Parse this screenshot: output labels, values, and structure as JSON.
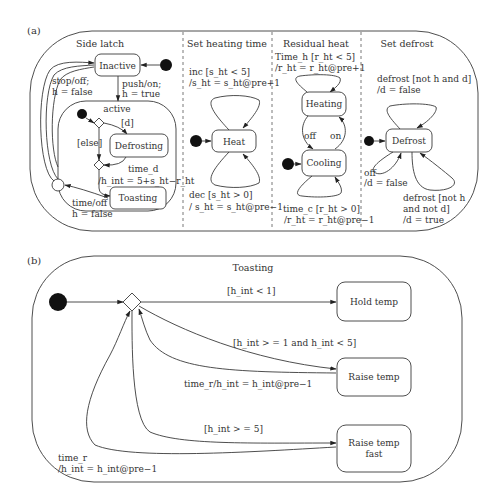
{
  "panel_a": {
    "label": "(a)",
    "regions": {
      "side_latch": {
        "title": "Side latch",
        "states": {
          "inactive": "Inactive",
          "active": "active",
          "defrosting": "Defrosting",
          "toasting": "Toasting"
        },
        "transitions": {
          "stop_off": [
            "stop/off;",
            "h = false"
          ],
          "push_on": [
            "push/on;",
            "h = true"
          ],
          "d_guard": "[d]",
          "else_guard": "[else]",
          "time_d": [
            "time_d",
            "/h_int = 5+s_ht−r_ht"
          ],
          "time_off": [
            "time/off",
            "h = false"
          ]
        }
      },
      "set_heating_time": {
        "title": "Set heating time",
        "states": {
          "heat": "Heat"
        },
        "transitions": {
          "inc": [
            "inc [s_ht < 5]",
            "/s_ht = s_ht@pre+1"
          ],
          "dec": [
            "dec [s_ht > 0]",
            "/ s_ht = s_ht@pre−1"
          ]
        }
      },
      "residual_heat": {
        "title": "Residual heat",
        "states": {
          "heating": "Heating",
          "cooling": "Cooling"
        },
        "transitions": {
          "time_h": [
            "Time_h [r_ht < 5]",
            "/r_ht = r_ht@pre+1"
          ],
          "off": "off",
          "on": "on",
          "time_c": [
            "time_c [r_ht > 0]",
            "/r_ht = r_ht@pre−1"
          ]
        }
      },
      "set_defrost": {
        "title": "Set defrost",
        "states": {
          "defrost": "Defrost"
        },
        "transitions": {
          "defrost_not_h_and_d": [
            "defrost [not h and d]",
            "/d = false"
          ],
          "off": [
            "off",
            "/d = false"
          ],
          "defrost_not_h_and_not_d": [
            "defrost [not h",
            "and not d]",
            "/d = true"
          ]
        }
      }
    }
  },
  "panel_b": {
    "label": "(b)",
    "title": "Toasting",
    "states": {
      "hold_temp": "Hold temp",
      "raise_temp": "Raise temp",
      "raise_temp_fast": [
        "Raise temp",
        "fast"
      ]
    },
    "transitions": {
      "lt1": "[h_int < 1]",
      "range": "[h_int > = 1 and h_int < 5]",
      "time_r_mid": "time_r/h_int = h_int@pre−1",
      "ge5": "[h_int > = 5]",
      "time_r_low": [
        "time_r",
        "/h_int = h_int@pre−1"
      ]
    }
  }
}
